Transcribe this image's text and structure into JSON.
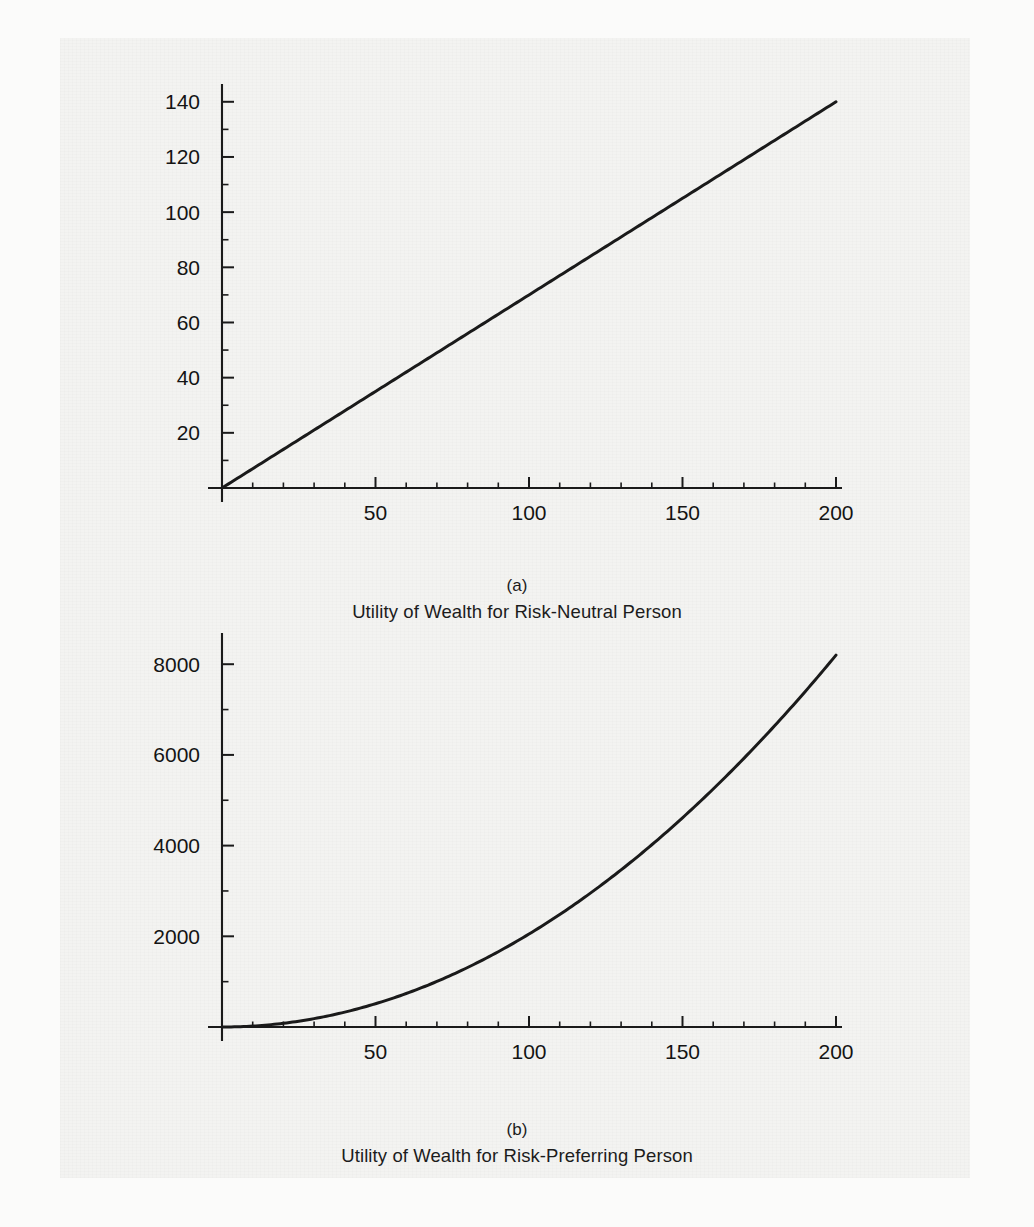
{
  "page": {
    "background_color": "#f3f3f1",
    "ink_color": "#1a1a1a"
  },
  "figures": [
    {
      "id": "a",
      "panel_letter": "(a)",
      "caption": "Utility of Wealth for Risk-Neutral Person"
    },
    {
      "id": "b",
      "panel_letter": "(b)",
      "caption": "Utility of Wealth for Risk-Preferring Person"
    }
  ],
  "chart_data": [
    {
      "type": "line",
      "title": "Utility of Wealth for Risk-Neutral Person",
      "panel": "(a)",
      "xlabel": "",
      "ylabel": "",
      "xlim": [
        0,
        200
      ],
      "ylim": [
        0,
        145
      ],
      "grid": false,
      "legend": "none",
      "x_ticks_major": [
        50,
        100,
        150,
        200
      ],
      "x_tick_labels": [
        "50",
        "100",
        "150",
        "200"
      ],
      "x_ticks_minor_step": 10,
      "y_ticks_major": [
        20,
        40,
        60,
        80,
        100,
        120,
        140
      ],
      "y_tick_labels": [
        "20",
        "40",
        "60",
        "80",
        "100",
        "120",
        "140"
      ],
      "y_ticks_minor_step": 10,
      "series": [
        {
          "name": "Utility (risk-neutral)",
          "relation": "U = 0.7 * W",
          "color": "#1a1a1a",
          "x": [
            0,
            25,
            50,
            75,
            100,
            125,
            150,
            175,
            200
          ],
          "values": [
            0,
            17.5,
            35,
            52.5,
            70,
            87.5,
            105,
            122.5,
            140
          ]
        }
      ]
    },
    {
      "type": "line",
      "title": "Utility of Wealth for Risk-Preferring Person",
      "panel": "(b)",
      "xlabel": "",
      "ylabel": "",
      "xlim": [
        0,
        200
      ],
      "ylim": [
        0,
        8600
      ],
      "grid": false,
      "legend": "none",
      "x_ticks_major": [
        50,
        100,
        150,
        200
      ],
      "x_tick_labels": [
        "50",
        "100",
        "150",
        "200"
      ],
      "x_ticks_minor_step": 10,
      "y_ticks_major": [
        2000,
        4000,
        6000,
        8000
      ],
      "y_tick_labels": [
        "2000",
        "4000",
        "6000",
        "8000"
      ],
      "y_ticks_minor_step": 1000,
      "series": [
        {
          "name": "Utility (risk-preferring)",
          "relation": "U = 0.205 * W^2",
          "color": "#1a1a1a",
          "x": [
            0,
            25,
            50,
            75,
            100,
            125,
            150,
            175,
            200
          ],
          "values": [
            0,
            128,
            513,
            1153,
            2050,
            3203,
            4613,
            6278,
            8200
          ]
        }
      ]
    }
  ]
}
